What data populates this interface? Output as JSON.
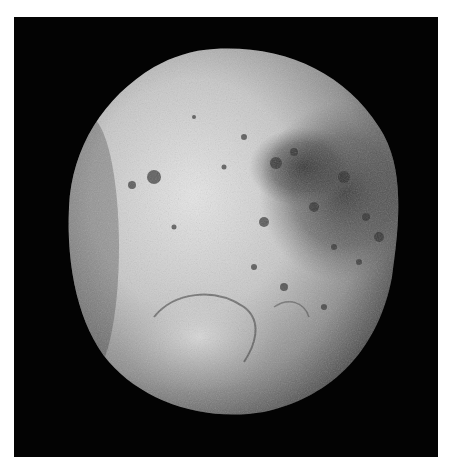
{
  "image": {
    "subject": "moon",
    "description": "Grayscale photograph of a cratered moon (Iapetus-like) against black space; left half bright, right half darker with dense cratered terrain",
    "colors": {
      "background_page": "#ffffff",
      "space": "#030303",
      "surface_bright": "#d9d9d9",
      "surface_mid": "#9a9a9a",
      "surface_dark": "#3a3a3a"
    }
  }
}
